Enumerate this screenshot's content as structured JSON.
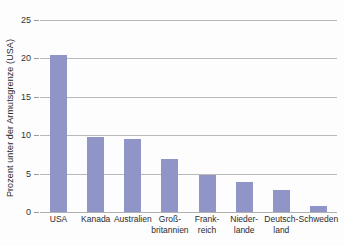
{
  "chart_data": {
    "type": "bar",
    "title": "",
    "xlabel": "",
    "ylabel": "Prozent unter der Armutsgrenze (USA)",
    "categories": [
      "USA",
      "Kanada",
      "Australien",
      "Groß-\nbritannien",
      "Frank-\nreich",
      "Nieder-\nlande",
      "Deutsch-\nland",
      "Schweden"
    ],
    "values": [
      20.4,
      9.8,
      9.5,
      6.9,
      4.8,
      3.9,
      2.9,
      0.8
    ],
    "ylim": [
      0,
      25
    ],
    "yticks": [
      0,
      5,
      10,
      15,
      20,
      25
    ],
    "ytick_labels": [
      "0",
      "5",
      "10",
      "15",
      "20",
      "25"
    ],
    "grid": true,
    "legend": "none",
    "bar_color": "#8f95c6",
    "grid_color": "#b9b9b9",
    "axis_text_color": "#2b2b2b"
  }
}
